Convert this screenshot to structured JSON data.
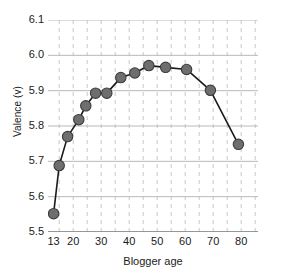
{
  "chart_data": {
    "type": "line",
    "title": "",
    "xlabel": "Blogger age",
    "ylabel": "Valence (v)",
    "xlim": [
      11,
      86
    ],
    "ylim": [
      5.5,
      6.1
    ],
    "x_ticks": [
      13,
      20,
      30,
      40,
      50,
      60,
      70,
      80
    ],
    "x_tick_labels": [
      "13",
      "20",
      "30",
      "40",
      "50",
      "60",
      "70",
      "80"
    ],
    "y_ticks": [
      5.5,
      5.6,
      5.7,
      5.8,
      5.9,
      6.0,
      6.1
    ],
    "y_tick_labels": [
      "5.5",
      "5.6",
      "5.7",
      "5.8",
      "5.9",
      "6.0",
      "6.1"
    ],
    "grid": "horizontal solid gridlines, vertical dashed minor gridlines every 5 years",
    "legend": "none",
    "marker": "filled circle",
    "marker_color": "#6e6e6e",
    "marker_edge_color": "#3c3c3c",
    "line_color": "#1a1a1a",
    "grid_color": "#c8c8c8",
    "series": [
      {
        "name": "Valence by blogger age",
        "x": [
          13,
          15,
          18,
          22,
          24.5,
          28,
          32,
          37,
          42,
          47,
          53,
          60.5,
          69,
          79
        ],
        "values": [
          5.552,
          5.688,
          5.77,
          5.818,
          5.857,
          5.893,
          5.893,
          5.937,
          5.95,
          5.971,
          5.966,
          5.96,
          5.901,
          5.748
        ]
      }
    ]
  },
  "figure": {
    "xlabel": "Blogger age",
    "ylabel": "Valence (v)"
  }
}
